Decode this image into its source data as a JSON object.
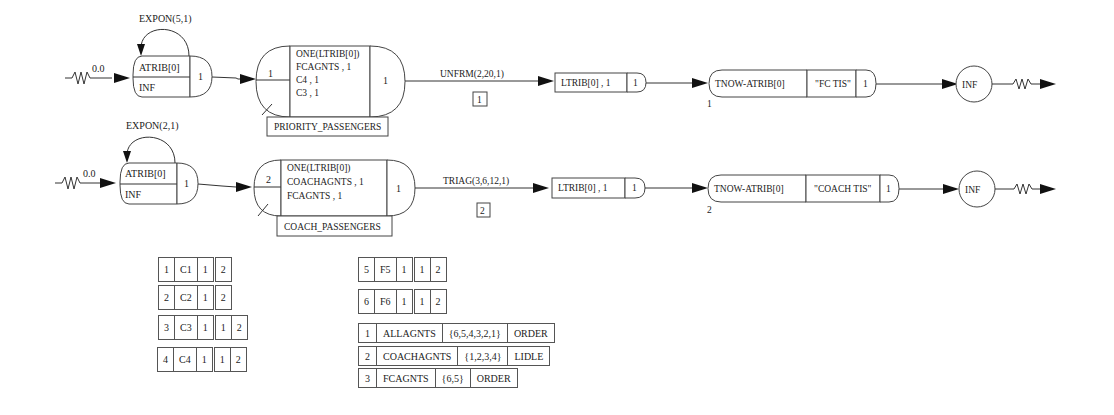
{
  "network": {
    "row1": {
      "create": {
        "offset": "0.0",
        "interval": "EXPON(5,1)",
        "attribute": "ATRIB[0]",
        "max": "INF",
        "branches": "1"
      },
      "await": {
        "file": "1",
        "alloc": "ONE(LTRIB[0])",
        "resources": [
          "FCAGNTS , 1",
          "C4 , 1",
          "C3 , 1"
        ],
        "branches": "1",
        "label": "PRIORITY_PASSENGERS"
      },
      "activity": {
        "duration": "UNFRM(2,20,1)",
        "number": "1"
      },
      "assign": {
        "expr": "LTRIB[0] , 1",
        "branches": "1"
      },
      "colct": {
        "expr": "TNOW-ATRIB[0]",
        "label": "\"FC TIS\"",
        "branches": "1",
        "number": "1"
      },
      "terminate": {
        "label": "INF"
      }
    },
    "row2": {
      "create": {
        "offset": "0.0",
        "interval": "EXPON(2,1)",
        "attribute": "ATRIB[0]",
        "max": "INF",
        "branches": "1"
      },
      "await": {
        "file": "2",
        "alloc": "ONE(LTRIB[0])",
        "resources": [
          "COACHAGNTS , 1",
          "FCAGNTS , 1"
        ],
        "branches": "1",
        "label": "COACH_PASSENGERS"
      },
      "activity": {
        "duration": "TRIAG(3,6,12,1)",
        "number": "2"
      },
      "assign": {
        "expr": "LTRIB[0] , 1",
        "branches": "1"
      },
      "colct": {
        "expr": "TNOW-ATRIB[0]",
        "label": "\"COACH TIS\"",
        "branches": "1",
        "number": "2"
      },
      "terminate": {
        "label": "INF"
      }
    }
  },
  "resources": [
    {
      "num": "1",
      "name": "C1",
      "cap": "1",
      "files": [
        "2"
      ]
    },
    {
      "num": "2",
      "name": "C2",
      "cap": "1",
      "files": [
        "2"
      ]
    },
    {
      "num": "3",
      "name": "C3",
      "cap": "1",
      "files": [
        "1",
        "2"
      ]
    },
    {
      "num": "4",
      "name": "C4",
      "cap": "1",
      "files": [
        "1",
        "2"
      ]
    },
    {
      "num": "5",
      "name": "F5",
      "cap": "1",
      "files": [
        "1",
        "2"
      ]
    },
    {
      "num": "6",
      "name": "F6",
      "cap": "1",
      "files": [
        "1",
        "2"
      ]
    }
  ],
  "groups": [
    {
      "num": "1",
      "name": "ALLAGNTS",
      "members": "{6,5,4,3,2,1}",
      "rule": "ORDER"
    },
    {
      "num": "2",
      "name": "COACHAGNTS",
      "members": "{1,2,3,4}",
      "rule": "LIDLE"
    },
    {
      "num": "3",
      "name": "FCAGNTS",
      "members": "{6,5}",
      "rule": "ORDER"
    }
  ]
}
